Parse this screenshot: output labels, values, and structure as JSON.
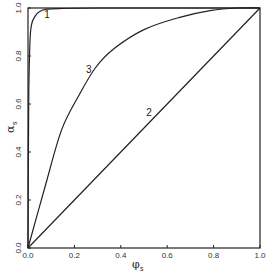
{
  "chart_data": {
    "type": "line",
    "title": "",
    "xlabel": "φs",
    "ylabel": "αs",
    "xlim": [
      0,
      1
    ],
    "ylim": [
      0,
      1
    ],
    "grid": false,
    "legend": "none (curves labeled inline 1, 2, 3)",
    "x_ticks": [
      "0.0",
      "0.2",
      "0.4",
      "0.6",
      "0.8",
      "1.0"
    ],
    "y_ticks": [
      "0.0",
      "0.2",
      "0.4",
      "0.6",
      "0.8",
      "1.0"
    ],
    "series": [
      {
        "name": "1",
        "x": [
          0,
          0.003,
          0.008,
          0.015,
          0.03,
          0.05,
          0.08,
          0.15,
          0.3,
          0.6,
          1.0
        ],
        "y": [
          0,
          0.6,
          0.85,
          0.93,
          0.965,
          0.985,
          0.995,
          0.998,
          1.0,
          1.0,
          1.0
        ],
        "label_pos": [
          0.07,
          0.96
        ]
      },
      {
        "name": "2",
        "x": [
          0,
          1.0
        ],
        "y": [
          0,
          1.0
        ],
        "label_pos": [
          0.51,
          0.55
        ]
      },
      {
        "name": "3",
        "x": [
          0,
          0.072,
          0.144,
          0.216,
          0.29,
          0.37,
          0.5,
          0.65,
          0.79,
          0.9,
          1.0
        ],
        "y": [
          0,
          0.25,
          0.49,
          0.63,
          0.75,
          0.83,
          0.91,
          0.96,
          0.99,
          1.0,
          1.0
        ],
        "label_pos": [
          0.25,
          0.73
        ]
      }
    ]
  },
  "labels": {
    "x_axis_main": "φ",
    "x_axis_sub": "s",
    "y_axis_main": "α",
    "y_axis_sub": "s"
  }
}
